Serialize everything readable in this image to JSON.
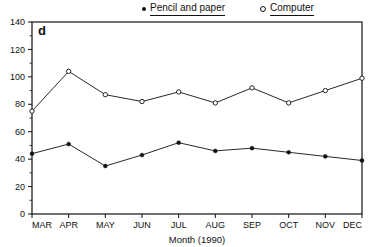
{
  "chart_data": {
    "type": "line",
    "title": "",
    "panel_label": "d",
    "xlabel": "Month (1990)",
    "ylabel": "",
    "categories": [
      "MAR",
      "APR",
      "MAY",
      "JUN",
      "JUL",
      "AUG",
      "SEP",
      "OCT",
      "NOV",
      "DEC"
    ],
    "ylim": [
      0,
      140
    ],
    "yticks": [
      0,
      20,
      40,
      60,
      80,
      100,
      120,
      140
    ],
    "ytick_labels": [
      "0",
      "20",
      "40",
      "60",
      "80",
      "100",
      "120",
      "140"
    ],
    "grid": false,
    "legend_position": "top",
    "series": [
      {
        "name": "Pencil and paper",
        "marker": "filled-circle",
        "color": "#111111",
        "values": [
          44,
          51,
          35,
          43,
          52,
          46,
          48,
          45,
          42,
          39
        ]
      },
      {
        "name": "Computer",
        "marker": "open-circle",
        "color": "#111111",
        "values": [
          75,
          104,
          87,
          82,
          89,
          81,
          92,
          81,
          90,
          99
        ]
      }
    ]
  },
  "legend": {
    "entries": [
      {
        "label": "Pencil and paper",
        "marker": "filled-circle-icon"
      },
      {
        "label": "Computer",
        "marker": "open-circle-icon"
      }
    ]
  },
  "axes": {
    "x_title": "Month (1990)",
    "panel_letter": "d"
  }
}
